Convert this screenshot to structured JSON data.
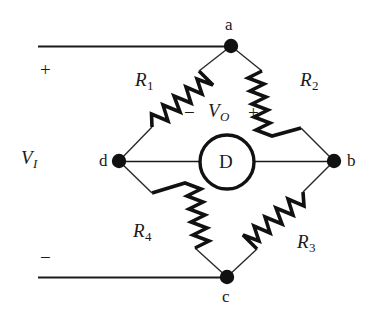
{
  "figure": {
    "background_color": "#ffffff",
    "line_color": "#1a1a1a",
    "stroke_color": "#111111"
  },
  "nodes": [
    {
      "id": "a",
      "label": "a",
      "x": 231,
      "y": 46
    },
    {
      "id": "b",
      "label": "b",
      "x": 334,
      "y": 161
    },
    {
      "id": "c",
      "label": "c",
      "x": 227,
      "y": 277
    },
    {
      "id": "d",
      "label": "d",
      "x": 119,
      "y": 161
    }
  ],
  "resistors": [
    {
      "id": "R1",
      "name": "R",
      "subscript": "1",
      "from": "d",
      "to": "a"
    },
    {
      "id": "R2",
      "name": "R",
      "subscript": "2",
      "from": "a",
      "to": "b"
    },
    {
      "id": "R3",
      "name": "R",
      "subscript": "3",
      "from": "b",
      "to": "c"
    },
    {
      "id": "R4",
      "name": "R",
      "subscript": "4",
      "from": "c",
      "to": "d"
    }
  ],
  "detector": {
    "label": "D",
    "description": "galvanometer detector between nodes d and b",
    "cx": 227,
    "cy": 162,
    "r": 27
  },
  "source": {
    "label": "V",
    "subscript": "I",
    "plus_sign": "+",
    "minus_sign": "−",
    "description": "input voltage across terminals a (+) and c (−)"
  },
  "output": {
    "label": "V",
    "subscript": "O",
    "minus_sign": "−",
    "plus_sign": "+",
    "description": "output voltage across detector, − on d side, + on b side"
  }
}
